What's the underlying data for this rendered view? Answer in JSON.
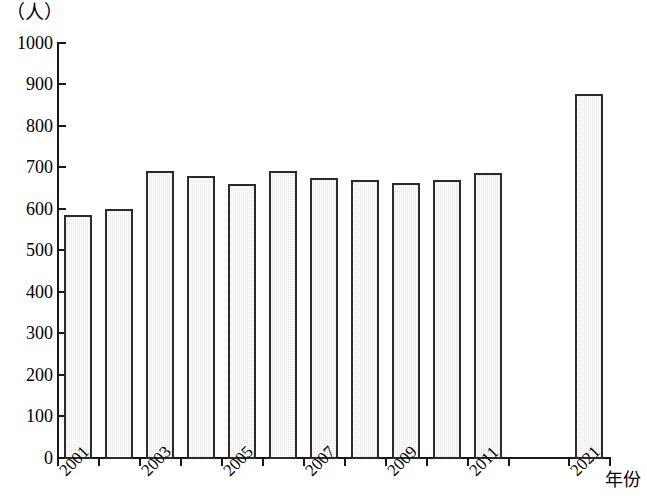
{
  "chart_data": {
    "type": "bar",
    "title": "",
    "subtitle": "",
    "xlabel": "年份",
    "ylabel": "（人）",
    "ylim": [
      0,
      1000
    ],
    "ytick_step": 100,
    "yticks": [
      1000,
      900,
      800,
      700,
      600,
      500,
      400,
      300,
      200,
      100,
      0
    ],
    "grid": false,
    "legend": null,
    "categories": [
      "2001",
      "2002",
      "2003",
      "2004",
      "2005",
      "2006",
      "2007",
      "2008",
      "2009",
      "2010",
      "2011",
      "",
      "",
      "2021"
    ],
    "tick_labels_shown": [
      "2001",
      "2003",
      "2005",
      "2007",
      "2009",
      "2011",
      "2021"
    ],
    "values": [
      585,
      600,
      690,
      678,
      660,
      690,
      675,
      670,
      662,
      668,
      687,
      null,
      null,
      875
    ],
    "bars": [
      {
        "category": "2001",
        "value": 585,
        "label_shown": "2001"
      },
      {
        "category": "2002",
        "value": 600,
        "label_shown": ""
      },
      {
        "category": "2003",
        "value": 690,
        "label_shown": "2003"
      },
      {
        "category": "2004",
        "value": 678,
        "label_shown": ""
      },
      {
        "category": "2005",
        "value": 660,
        "label_shown": "2005"
      },
      {
        "category": "2006",
        "value": 690,
        "label_shown": ""
      },
      {
        "category": "2007",
        "value": 675,
        "label_shown": "2007"
      },
      {
        "category": "2008",
        "value": 670,
        "label_shown": ""
      },
      {
        "category": "2009",
        "value": 662,
        "label_shown": "2009"
      },
      {
        "category": "2010",
        "value": 668,
        "label_shown": ""
      },
      {
        "category": "2011",
        "value": 687,
        "label_shown": "2011"
      },
      {
        "category": "2021",
        "value": 875,
        "label_shown": "2021"
      }
    ],
    "colors": {
      "bar_fill": "#e3e3e3",
      "bar_border": "#2b2b2b",
      "axis": "#1a1a1a",
      "text": "#000000",
      "background": "#ffffff"
    }
  },
  "axis": {
    "y_unit_label": "（人）",
    "x_title": "年份",
    "y_labels": {
      "t1000": "1000",
      "t900": "900",
      "t800": "800",
      "t700": "700",
      "t600": "600",
      "t500": "500",
      "t400": "400",
      "t300": "300",
      "t200": "200",
      "t100": "100",
      "t0": "0"
    },
    "x_labels": {
      "l2001": "2001",
      "l2003": "2003",
      "l2005": "2005",
      "l2007": "2007",
      "l2009": "2009",
      "l2011": "2011",
      "l2021": "2021"
    }
  }
}
